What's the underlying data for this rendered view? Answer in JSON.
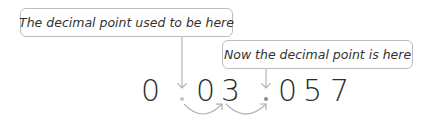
{
  "callouts": {
    "old_position": "The decimal point used to be here",
    "new_position": "Now the decimal point is here"
  },
  "number": {
    "digits": [
      "0",
      "0",
      "3",
      "0",
      "5",
      "7"
    ],
    "old_decimal_after_index": 0,
    "new_decimal_after_index": 2,
    "display": "0 . 0 3 . 0 5 7"
  },
  "colors": {
    "digit": "#2b2b2b",
    "old_dot": "#c8c8c8",
    "new_dot": "#8a8a8a",
    "arrow": "#b0b0b0",
    "box_border": "#bdbdbd"
  },
  "moves": [
    {
      "from": "after digit 1",
      "to": "after digit 2"
    },
    {
      "from": "after digit 2",
      "to": "after digit 3"
    }
  ]
}
